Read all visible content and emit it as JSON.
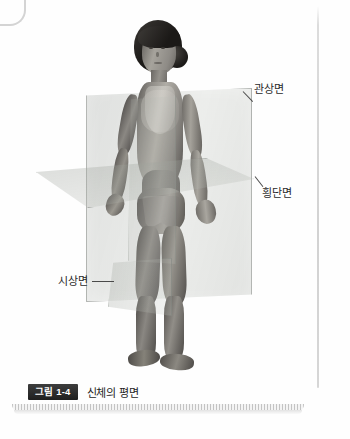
{
  "figure": {
    "badge": "그림 1-4",
    "caption": "신체의 평면",
    "alt_title": "신체의 평면"
  },
  "labels": {
    "coronal": "관상면",
    "transverse": "횡단면",
    "sagittal": "시상면"
  },
  "planes": [
    {
      "id": "coronal",
      "label": "관상면",
      "orientation": "vertical-frontal"
    },
    {
      "id": "transverse",
      "label": "횡단면",
      "orientation": "horizontal"
    },
    {
      "id": "sagittal",
      "label": "시상면",
      "orientation": "vertical-median"
    }
  ],
  "subject": {
    "description": "standing human figure, anatomical position",
    "hair": "dark, tied back in a bun",
    "attire": "two-piece swimsuit"
  },
  "colors": {
    "background": "#ffffff",
    "plane_fill": "#9aa096",
    "plane_edge": "#787d78",
    "badge_background": "#1f1f1f",
    "badge_text": "#ffffff",
    "caption_text": "#1d1d1d",
    "frame_rule": "#d4d4d4"
  }
}
